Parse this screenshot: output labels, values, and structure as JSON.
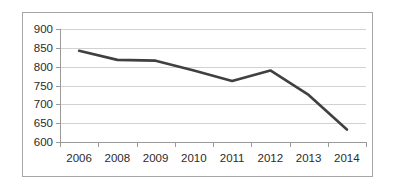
{
  "chart_data": {
    "type": "line",
    "title": "",
    "xlabel": "",
    "ylabel": "",
    "categories": [
      "2006",
      "2008",
      "2009",
      "2010",
      "2011",
      "2012",
      "2013",
      "2014"
    ],
    "values": [
      842,
      818,
      816,
      790,
      762,
      790,
      725,
      633
    ],
    "series": [
      {
        "name": "",
        "values": [
          842,
          818,
          816,
          790,
          762,
          790,
          725,
          633
        ]
      }
    ],
    "ylim": [
      600,
      900
    ],
    "ytick_labels": [
      "900",
      "850",
      "800",
      "750",
      "700",
      "650",
      "600"
    ],
    "ytick_values": [
      900,
      850,
      800,
      750,
      700,
      650,
      600
    ],
    "ytick_step": 50,
    "grid": true,
    "grid_axis": "y",
    "legend": false,
    "legend_position": "none",
    "line_color": "#404040",
    "grid_color": "#d2d2d2",
    "axis_color": "#9a9a9a",
    "border_color": "#a6a6a6",
    "background": "#ffffff",
    "annotations": []
  }
}
